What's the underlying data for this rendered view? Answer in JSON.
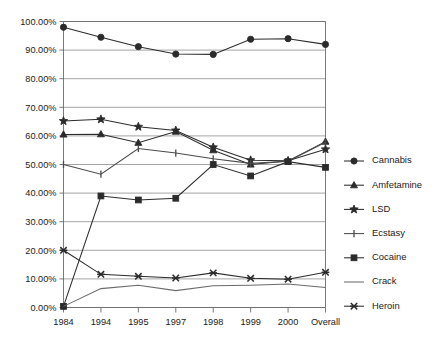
{
  "chart_data": {
    "type": "line",
    "title": "",
    "subtitle": "",
    "xlabel": "",
    "ylabel": "",
    "categories": [
      "1984",
      "1994",
      "1995",
      "1997",
      "1998",
      "1999",
      "2000",
      "Overall"
    ],
    "ylim": [
      0,
      100
    ],
    "ytick_labels": [
      "0.00%",
      "10.00%",
      "20.00%",
      "30.00%",
      "40.00%",
      "50.00%",
      "60.00%",
      "70.00%",
      "80.00%",
      "90.00%",
      "100.00%"
    ],
    "ytick_values": [
      0,
      10,
      20,
      30,
      40,
      50,
      60,
      70,
      80,
      90,
      100
    ],
    "grid": true,
    "legend_position": "right",
    "series": [
      {
        "name": "Cannabis",
        "marker": "circle",
        "color": "#2b2b2b",
        "values": [
          98.0,
          94.5,
          91.2,
          88.6,
          88.5,
          93.8,
          94.0,
          92.0
        ]
      },
      {
        "name": "Amfetamine",
        "marker": "triangle",
        "color": "#2b2b2b",
        "values": [
          60.5,
          60.6,
          57.6,
          61.5,
          55.0,
          50.0,
          51.2,
          58.0
        ]
      },
      {
        "name": "LSD",
        "marker": "star",
        "color": "#2b2b2b",
        "values": [
          65.2,
          65.8,
          63.2,
          61.9,
          56.0,
          51.5,
          51.3,
          55.3
        ]
      },
      {
        "name": "Ecstasy",
        "marker": "bar",
        "color": "#4a4a4a",
        "values": [
          50.0,
          46.6,
          55.6,
          54.0,
          52.0,
          50.4,
          51.1,
          57.8
        ]
      },
      {
        "name": "Cocaine",
        "marker": "square",
        "color": "#2b2b2b",
        "values": [
          0.4,
          39.0,
          37.6,
          38.2,
          50.0,
          46.0,
          51.0,
          49.0
        ]
      },
      {
        "name": "Crack",
        "marker": "none",
        "color": "#6b6b6b",
        "values": [
          0.4,
          6.6,
          7.8,
          5.9,
          7.6,
          7.8,
          8.2,
          7.0
        ]
      },
      {
        "name": "Heroin",
        "marker": "cross",
        "color": "#2b2b2b",
        "values": [
          20.0,
          11.6,
          10.9,
          10.3,
          12.1,
          10.2,
          9.9,
          12.3
        ]
      }
    ]
  },
  "legend": {
    "items": [
      {
        "label": "Cannabis",
        "marker": "circle"
      },
      {
        "label": "Amfetamine",
        "marker": "triangle"
      },
      {
        "label": "LSD",
        "marker": "star"
      },
      {
        "label": "Ecstasy",
        "marker": "bar"
      },
      {
        "label": "Cocaine",
        "marker": "square"
      },
      {
        "label": "Crack",
        "marker": "none"
      },
      {
        "label": "Heroin",
        "marker": "cross"
      }
    ]
  },
  "colors": {
    "background": "#ffffff",
    "grid": "#8d8d8d",
    "axis": "#6b6b6b",
    "text": "#1a1a1a",
    "series_dark": "#2b2b2b",
    "series_mid": "#4a4a4a",
    "series_light": "#6b6b6b"
  }
}
